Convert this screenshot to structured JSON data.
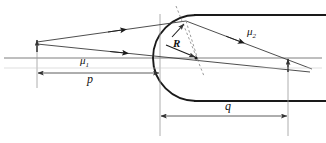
{
  "figure": {
    "kind": "optics-refraction-diagram",
    "background_color": "#ffffff",
    "line_color": "#1a1a1a",
    "thin_line_color": "#6f6f6f",
    "dashed_color": "#8a8a8a"
  },
  "labels": {
    "mu1": {
      "text": "μ",
      "sub": "1",
      "x": 83,
      "y": 62
    },
    "mu2": {
      "text": "μ",
      "sub": "2",
      "x": 249,
      "y": 27
    },
    "p": {
      "text": "p",
      "x": 89,
      "y": 77
    },
    "q": {
      "text": "q",
      "x": 227,
      "y": 105
    },
    "R": {
      "text": "R",
      "x": 174,
      "y": 39
    }
  },
  "geometry": {
    "optical_axis": {
      "x1": 4,
      "y1": 58,
      "x2": 322,
      "y2": 58
    },
    "object_point": {
      "x": 37,
      "y": 42
    },
    "vertex": {
      "x": 160,
      "y": 58
    },
    "center_of_curvature": {
      "x": 196,
      "y": 58
    },
    "image_point": {
      "x": 288,
      "y": 62
    },
    "refraction_point": {
      "x": 184,
      "y": 22
    },
    "surface_radius": 43,
    "lens_top_edge_y": 15,
    "lens_bottom_edge_y": 101,
    "lens_right_x": 326,
    "dimension_p": {
      "x1": 37,
      "x2": 160,
      "y": 73
    },
    "dimension_q": {
      "x1": 160,
      "x2": 288,
      "y": 116
    }
  },
  "rays": {
    "incident_upper": {
      "from_x": 37,
      "from_y": 42,
      "to_x": 184,
      "to_y": 22,
      "arrow_x": 122,
      "arrow_y": 29
    },
    "incident_lower": {
      "from_x": 37,
      "from_y": 44,
      "to_x": 288,
      "to_y": 62,
      "arrow_x": 125,
      "arrow_y": 50
    },
    "refracted": {
      "from_x": 184,
      "from_y": 22,
      "to_x": 310,
      "to_y": 70,
      "arrow_x": 240,
      "arrow_y": 44
    },
    "radius_arrow": {
      "from_x": 164,
      "from_y": 30,
      "to_x": 196,
      "to_y": 58
    },
    "normal_dashed": {
      "x1": 176,
      "y1": 7,
      "x2": 203,
      "y2": 75
    }
  }
}
